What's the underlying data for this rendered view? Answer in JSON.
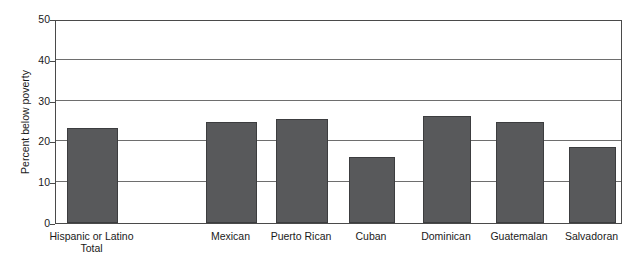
{
  "chart_data": {
    "type": "bar",
    "title": "",
    "xlabel": "",
    "ylabel": "Percent below poverty",
    "ylim": [
      0,
      50
    ],
    "ytick_labels": [
      "0",
      "10",
      "20",
      "30",
      "40",
      "50"
    ],
    "ytick_values": [
      0,
      10,
      20,
      30,
      40,
      50
    ],
    "grid": "horizontal",
    "legend": "none",
    "bar_color": "#58595b",
    "categories": [
      "Hispanic or Latino\nTotal",
      "Mexican",
      "Puerto Rican",
      "Cuban",
      "Dominican",
      "Guatemalan",
      "Salvadoran"
    ],
    "values": [
      23.2,
      24.7,
      25.4,
      16.1,
      26.2,
      24.8,
      18.6
    ]
  },
  "axis": {
    "y_title": "Percent below poverty"
  }
}
